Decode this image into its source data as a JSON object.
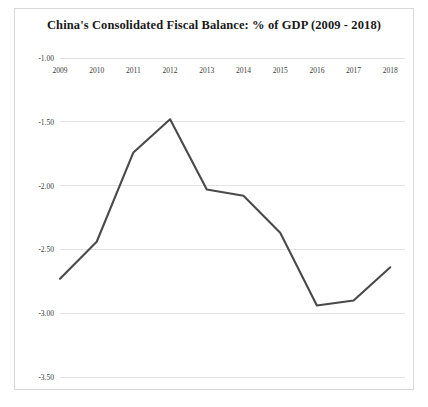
{
  "chart_data": {
    "type": "line",
    "title": "China's Consolidated Fiscal Balance: % of GDP (2009 - 2018)",
    "xlabel": "",
    "ylabel": "",
    "categories": [
      "2009",
      "2010",
      "2011",
      "2012",
      "2013",
      "2014",
      "2015",
      "2016",
      "2017",
      "2018"
    ],
    "values": [
      -2.73,
      -2.44,
      -1.74,
      -1.48,
      -2.03,
      -2.08,
      -2.37,
      -2.94,
      -2.9,
      -2.64
    ],
    "series": [
      {
        "name": "Consolidated Fiscal Balance (% of GDP)",
        "values": [
          -2.73,
          -2.44,
          -1.74,
          -1.48,
          -2.03,
          -2.08,
          -2.37,
          -2.94,
          -2.9,
          -2.64
        ]
      }
    ],
    "ylim": [
      -3.5,
      -1.0
    ],
    "y_ticks": [
      -1.0,
      -1.5,
      -2.0,
      -2.5,
      -3.0,
      -3.5
    ],
    "y_tick_labels": [
      "-1.00",
      "-1.50",
      "-2.00",
      "-2.50",
      "-3.00",
      "-3.50"
    ],
    "x_tick_labels": [
      "2009",
      "2010",
      "2011",
      "2012",
      "2013",
      "2014",
      "2015",
      "2016",
      "2017",
      "2018"
    ],
    "grid": true,
    "grid_axis": "y",
    "legend": false,
    "legend_position": "none",
    "colors": {
      "line": "#4a4a4a",
      "grid": "#e3e3e3",
      "text": "#3a3a3a",
      "title": "#1a1a1a",
      "background": "#ffffff",
      "border": "#d8d8d8"
    }
  }
}
